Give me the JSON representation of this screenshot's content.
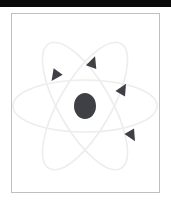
{
  "page": {
    "width": 171,
    "height": 203,
    "background_color": "#ffffff"
  },
  "top_bar": {
    "name": "top-dark-bar",
    "color": "#0a0a0a",
    "height": 7
  },
  "figure": {
    "title": "",
    "frame": {
      "border_color": "#bfbfbf",
      "background_color": "#ffffff",
      "x": 11,
      "y": 13,
      "width": 149,
      "height": 180
    },
    "illustration_name": "atom-diagram",
    "nucleus": {
      "name": "nucleus",
      "color": "#3f4045",
      "cx": 73,
      "cy": 92,
      "rx": 11,
      "ry": 13
    },
    "orbit_color": "#ededed",
    "orbit_stroke_width": 1.6,
    "orbits": [
      {
        "name": "orbit-horizontal",
        "rx": 72,
        "ry": 26,
        "rotation": 0
      },
      {
        "name": "orbit-tilted-left",
        "rx": 72,
        "ry": 26,
        "rotation": 60
      },
      {
        "name": "orbit-tilted-right",
        "rx": 72,
        "ry": 26,
        "rotation": 120
      }
    ],
    "electron_color": "#3f4045",
    "electrons": [
      {
        "name": "electron-upper-left",
        "x": 43,
        "y": 62,
        "rotation": 215
      },
      {
        "name": "electron-upper-center",
        "x": 81,
        "y": 48,
        "rotation": 20
      },
      {
        "name": "electron-upper-right",
        "x": 111,
        "y": 75,
        "rotation": 30
      },
      {
        "name": "electron-lower-right",
        "x": 120,
        "y": 122,
        "rotation": 150
      }
    ]
  }
}
